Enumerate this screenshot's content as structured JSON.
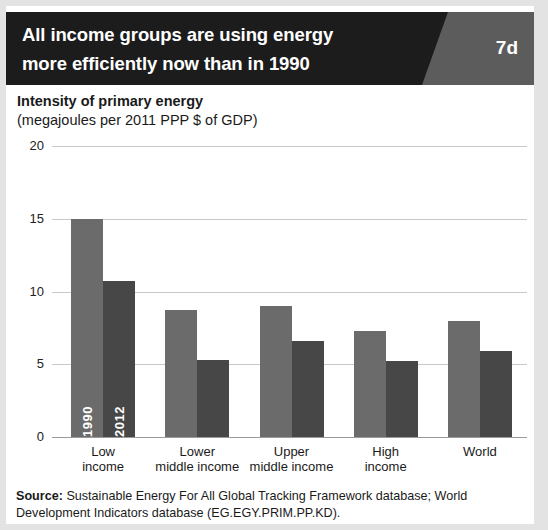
{
  "header": {
    "title_line1": "All income groups are using energy",
    "title_line2": "more efficiently now than in 1990",
    "badge": "7d",
    "bar_color": "#1c1c1c",
    "badge_color": "#5c5c5c"
  },
  "subtitle": {
    "line1": "Intensity of primary energy",
    "line2": "(megajoules per 2011 PPP $ of GDP)"
  },
  "source": {
    "label": "Source:",
    "text": " Sustainable Energy For All Global Tracking Framework database; World Development Indicators database (EG.EGY.PRIM.PP.KD)."
  },
  "chart_data": {
    "type": "bar",
    "title": "All income groups are using energy more efficiently now than in 1990",
    "subtitle": "Intensity of primary energy (megajoules per 2011 PPP $ of GDP)",
    "xlabel": "",
    "ylabel": "Intensity of primary energy (megajoules per 2011 PPP $ of GDP)",
    "ylim": [
      0,
      20
    ],
    "yticks": [
      0,
      5,
      10,
      15,
      20
    ],
    "ytick_labels": [
      "0",
      "5",
      "10",
      "15",
      "20"
    ],
    "grid": true,
    "legend": "in-bar",
    "categories": [
      "Low income",
      "Lower middle income",
      "Upper middle income",
      "High income",
      "World"
    ],
    "category_lines": [
      [
        "Low",
        "income"
      ],
      [
        "Lower",
        "middle income"
      ],
      [
        "Upper",
        "middle income"
      ],
      [
        "High",
        "income"
      ],
      [
        "World",
        ""
      ]
    ],
    "series": [
      {
        "name": "1990",
        "color": "#6b6b6b",
        "values": [
          15.0,
          8.7,
          9.0,
          7.3,
          8.0
        ]
      },
      {
        "name": "2012",
        "color": "#474747",
        "values": [
          10.7,
          5.3,
          6.6,
          5.2,
          5.9
        ]
      }
    ]
  }
}
